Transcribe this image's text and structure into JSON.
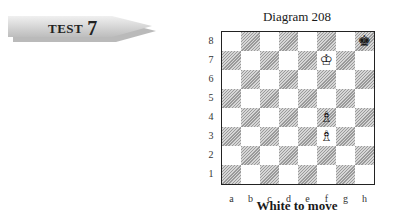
{
  "banner": {
    "label": "TEST",
    "number": "7"
  },
  "diagram": {
    "title": "Diagram 208",
    "caption": "White to move",
    "ranks": [
      "8",
      "7",
      "6",
      "5",
      "4",
      "3",
      "2",
      "1"
    ],
    "files": [
      "a",
      "b",
      "c",
      "d",
      "e",
      "f",
      "g",
      "h"
    ],
    "pieces": [
      {
        "square": "h8",
        "piece": "black-king",
        "glyph": "♚"
      },
      {
        "square": "f7",
        "piece": "white-king",
        "glyph": "♔"
      },
      {
        "square": "f4",
        "piece": "white-bishop",
        "glyph": "♗"
      },
      {
        "square": "f3",
        "piece": "white-bishop",
        "glyph": "♗"
      }
    ]
  }
}
